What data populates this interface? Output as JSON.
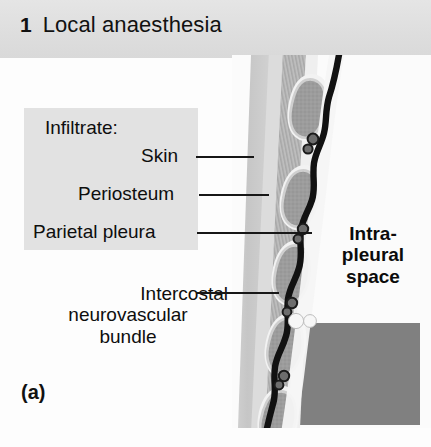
{
  "figure": {
    "number": "1",
    "title": "Local anaesthesia",
    "subfigure_letter": "(a)"
  },
  "labels": {
    "infiltrate": "Infiltrate:",
    "skin": "Skin",
    "periosteum": "Periosteum",
    "parietal_pleura": "Parietal pleura",
    "intercostal_line1": "Intercostal",
    "intercostal_line2": "neurovascular",
    "intercostal_line3": "bundle",
    "intrapleural_line1": "Intra-",
    "intrapleural_line2": "pleural",
    "intrapleural_line3": "space"
  },
  "colors": {
    "title_band": "#e0e0e0",
    "label_panel": "#e2e2e2",
    "page_background": "#fdfdfd",
    "skin_layer": "#c9c9c9",
    "subcutaneous": "#d6d6d6",
    "muscle_layer": "#bfbfbf",
    "rib_fill": "#9a9a9a",
    "rib_outline": "#d9d9d9",
    "pleura_line": "#111111",
    "effusion_fill": "#808080",
    "bubble_fill": "#f5f5f5",
    "leader_line": "#171717",
    "text": "#0e0e0e"
  },
  "illustration": {
    "description": "Sagittal cross-section of the chest wall showing stacked rib cross-sections, intercostal muscles, the parietal pleura as a thick black line, intercostal neurovascular bundles beneath each rib, and a shaded intra-pleural effusion with two air bubbles.",
    "rib_count": 5,
    "bubble_count": 2,
    "neurovascular_bundle_count": 5
  }
}
